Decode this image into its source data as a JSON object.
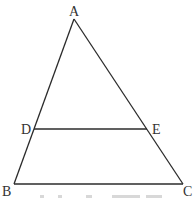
{
  "diagram": {
    "type": "triangle-with-parallel-segment",
    "points": {
      "A": {
        "label": "A",
        "x": 74,
        "y": 19
      },
      "B": {
        "label": "B",
        "x": 14,
        "y": 184
      },
      "C": {
        "label": "C",
        "x": 183,
        "y": 184
      },
      "D": {
        "label": "D",
        "x": 34,
        "y": 129
      },
      "E": {
        "label": "E",
        "x": 147,
        "y": 129
      }
    },
    "segments": [
      "AB",
      "AC",
      "BC",
      "DE"
    ],
    "relations": [
      "D on AB",
      "E on AC",
      "DE parallel to BC"
    ],
    "colors": {
      "line": "#2b2b2b",
      "label": "#333333",
      "background": "#ffffff"
    }
  }
}
